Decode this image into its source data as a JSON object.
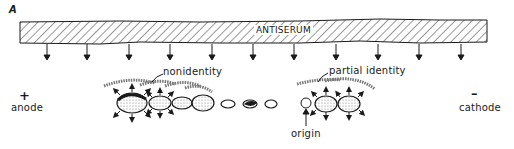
{
  "figure": {
    "panel_label": "A",
    "antiserum_label": "ANTISERUM",
    "anode": {
      "sign": "+",
      "label": "anode"
    },
    "cathode": {
      "sign": "–",
      "label": "cathode"
    },
    "annotations": {
      "nonidentity": "nonidentity",
      "partial_identity": "partial identity",
      "origin": "origin"
    }
  },
  "colors": {
    "ink": "#1a1a1a",
    "background": "#ffffff",
    "precipitin_arc": "#777777"
  }
}
